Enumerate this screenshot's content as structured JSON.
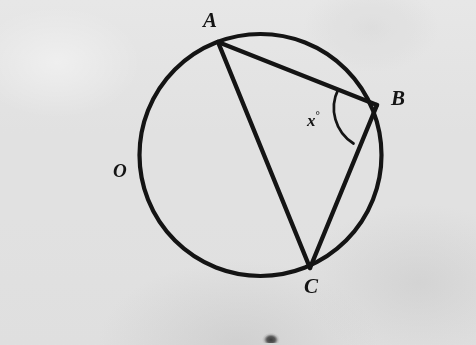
{
  "figure": {
    "type": "circle-geometry-diagram",
    "background_color": "#f1f1f1",
    "stroke_color": "#141414",
    "labels": {
      "point_a": "A",
      "point_b": "B",
      "point_c": "C",
      "center_o": "O",
      "angle_variable": "x",
      "angle_degree_symbol": "°"
    },
    "circle": {
      "center_x": 260.5,
      "center_y": 155,
      "radius": 121,
      "stroke_width": 4.2
    },
    "points": [
      {
        "name": "A",
        "x": 218,
        "y": 42
      },
      {
        "name": "B",
        "x": 377,
        "y": 105
      },
      {
        "name": "C",
        "x": 310,
        "y": 268
      }
    ],
    "chords": [
      {
        "name": "chord-ab",
        "from": "A",
        "to": "B",
        "stroke_width": 4.4
      },
      {
        "name": "chord-ac",
        "from": "A",
        "to": "C",
        "stroke_width": 4.4
      },
      {
        "name": "chord-bc",
        "from": "B",
        "to": "C",
        "stroke_width": 4.4
      }
    ],
    "angle_arc": {
      "vertex": "B",
      "radius": 42,
      "start_x": 341.6,
      "start_y": 91.7,
      "end_x": 354.0,
      "end_y": 139.6,
      "stroke_width": 2.6
    },
    "label_positions": {
      "A": {
        "x": 210,
        "y": 21
      },
      "B": {
        "x": 397,
        "y": 99
      },
      "C": {
        "x": 311,
        "y": 287
      },
      "O": {
        "x": 121,
        "y": 172
      },
      "x": {
        "x": 318,
        "y": 122
      }
    }
  }
}
